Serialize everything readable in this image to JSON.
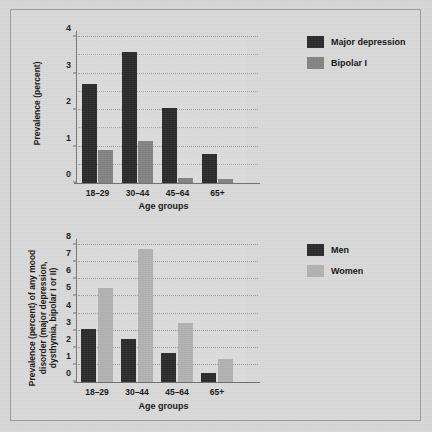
{
  "page": {
    "background_color": "#d7d7d7",
    "frame_color": "#9a9a9a"
  },
  "colors": {
    "dark_series": "#2b2b2b",
    "mid_gray_series": "#838383",
    "light_gray_series": "#b2b2b2",
    "axis": "#6f6f6f",
    "grid": "#a9a9a9",
    "text": "#161616",
    "plot_background": "#dcdcdc"
  },
  "chart_data": [
    {
      "id": "top",
      "type": "bar",
      "title": "",
      "xlabel": "Age groups",
      "ylabel": "Prevalence (percent)",
      "categories": [
        "18–29",
        "30–44",
        "45–64",
        "65+"
      ],
      "ylim": [
        0,
        4
      ],
      "yticks": [
        0,
        1,
        2,
        3,
        4
      ],
      "ytick_labels": [
        "0",
        "1",
        "2",
        "3",
        "4"
      ],
      "minor_tick_interval": 0.5,
      "grid": true,
      "legend_position": "right",
      "series": [
        {
          "name": "Major depression",
          "color": "#2b2b2b",
          "values": [
            2.7,
            3.6,
            2.05,
            0.8
          ]
        },
        {
          "name": "Bipolar I",
          "color": "#838383",
          "values": [
            0.9,
            1.15,
            0.15,
            0.1
          ]
        }
      ]
    },
    {
      "id": "bottom",
      "type": "bar",
      "title": "",
      "xlabel": "Age groups",
      "ylabel": "Prevalence (percent) of any mood\ndisorder (major depression,\ndysthymia, bipolar I or II)",
      "categories": [
        "18–29",
        "30–44",
        "45–64",
        "65+"
      ],
      "ylim": [
        0,
        8
      ],
      "yticks": [
        0,
        1,
        2,
        3,
        4,
        5,
        6,
        7,
        8
      ],
      "ytick_labels": [
        "0",
        "1",
        "2",
        "3",
        "4",
        "5",
        "6",
        "7",
        "8"
      ],
      "minor_tick_interval": 1,
      "grid": true,
      "legend_position": "right",
      "series": [
        {
          "name": "Men",
          "color": "#2b2b2b",
          "values": [
            3.1,
            2.5,
            1.7,
            0.55
          ]
        },
        {
          "name": "Women",
          "color": "#b2b2b2",
          "values": [
            5.5,
            7.75,
            3.45,
            1.35
          ]
        }
      ]
    }
  ]
}
